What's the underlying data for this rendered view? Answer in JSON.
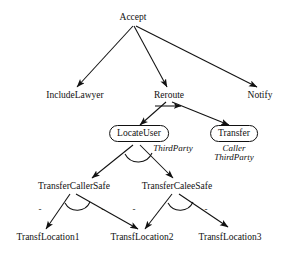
{
  "diagram": {
    "type": "goal-refinement-tree",
    "stroke_color": "#111111",
    "background_color": "#ffffff",
    "nodes": [
      {
        "id": "accept",
        "label": "Accept",
        "shape": "plain",
        "x": 133,
        "y": 18
      },
      {
        "id": "include-lawyer",
        "label": "IncludeLawyer",
        "shape": "plain",
        "x": 75,
        "y": 96
      },
      {
        "id": "reroute",
        "label": "Reroute",
        "shape": "plain",
        "x": 169,
        "y": 96
      },
      {
        "id": "notify",
        "label": "Notify",
        "shape": "plain",
        "x": 260,
        "y": 96
      },
      {
        "id": "locate-user",
        "label": "LocateUser",
        "shape": "rounded",
        "x": 139,
        "y": 134
      },
      {
        "id": "transfer",
        "label": "Transfer",
        "shape": "rounded",
        "x": 234,
        "y": 134
      },
      {
        "id": "transfer-caller-safe",
        "label": "TransferCallerSafe",
        "shape": "plain",
        "x": 74,
        "y": 187
      },
      {
        "id": "transfer-calee-safe",
        "label": "TransferCaleeSafe",
        "shape": "plain",
        "x": 177,
        "y": 187
      },
      {
        "id": "transf-location-1",
        "label": "TransfLocation1",
        "shape": "plain",
        "x": 48,
        "y": 238
      },
      {
        "id": "transf-location-2",
        "label": "TransfLocation2",
        "shape": "plain",
        "x": 142,
        "y": 238
      },
      {
        "id": "transf-location-3",
        "label": "TransfLocation3",
        "shape": "plain",
        "x": 230,
        "y": 238
      }
    ],
    "annotations": [
      {
        "id": "third-party-locate",
        "lines": [
          "ThirdParty"
        ],
        "x": 173,
        "y": 146
      },
      {
        "id": "caller-third-party",
        "lines": [
          "Caller",
          "ThirdParty"
        ],
        "x": 234,
        "y": 146
      }
    ],
    "edge_markers": [
      {
        "id": "dash-1",
        "label": "-",
        "x": 40,
        "y": 209
      },
      {
        "id": "dash-2",
        "label": "-",
        "x": 103,
        "y": 209
      },
      {
        "id": "dash-3",
        "label": "-",
        "x": 134,
        "y": 209
      },
      {
        "id": "dash-4",
        "label": "-",
        "x": 206,
        "y": 209
      }
    ]
  }
}
